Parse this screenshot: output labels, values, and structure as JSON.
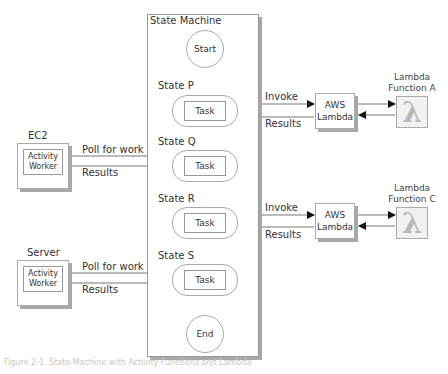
{
  "state_machine": {
    "title": "State Machine",
    "start_label": "Start",
    "end_label": "End",
    "states": [
      {
        "name": "State P",
        "task_label": "Task"
      },
      {
        "name": "State Q",
        "task_label": "Task"
      },
      {
        "name": "State R",
        "task_label": "Task"
      },
      {
        "name": "State S",
        "task_label": "Task"
      }
    ]
  },
  "lambda_integrations": [
    {
      "state": "State P",
      "invoke_label": "Invoke",
      "results_label": "Results",
      "service_label": "AWS Lambda",
      "function_label": "Lambda Function A",
      "function_icon": "lambda-icon"
    },
    {
      "state": "State R",
      "invoke_label": "Invoke",
      "results_label": "Results",
      "service_label": "AWS Lambda",
      "function_label": "Lambda Function C",
      "function_icon": "lambda-icon"
    }
  ],
  "activity_workers": [
    {
      "state": "State Q",
      "host_label": "EC2",
      "worker_label": "Activity Worker",
      "poll_label": "Poll for work",
      "results_label": "Results"
    },
    {
      "state": "State S",
      "host_label": "Server",
      "worker_label": "Activity Worker",
      "poll_label": "Poll for work",
      "results_label": "Results"
    }
  ],
  "caption": "Figure 2-1. State Machine with Activity Functions and Lambda",
  "colors": {
    "border": "#aaaaaa",
    "shadow": "#a8a8a8",
    "text": "#333333",
    "arrow": "#111111",
    "lambda_glyph": "#b8b8b8"
  }
}
